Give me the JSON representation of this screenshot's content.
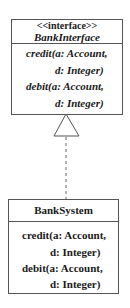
{
  "interface_class": {
    "stereotype": "<<interface>>",
    "name": "BankInterface",
    "operations": [
      {
        "line1": "credit(a: Account,",
        "line2": "d: Integer)"
      },
      {
        "line1": "debit(a: Account,",
        "line2": "d: Integer)"
      }
    ]
  },
  "implementing_class": {
    "name": "BankSystem",
    "operations": [
      {
        "line1": "credit(a: Account,",
        "line2": "d: Integer)"
      },
      {
        "line1": "debit(a: Account,",
        "line2": "d: Integer)"
      }
    ]
  },
  "relationship": {
    "type": "realization",
    "style": "dashed line with hollow triangle"
  }
}
